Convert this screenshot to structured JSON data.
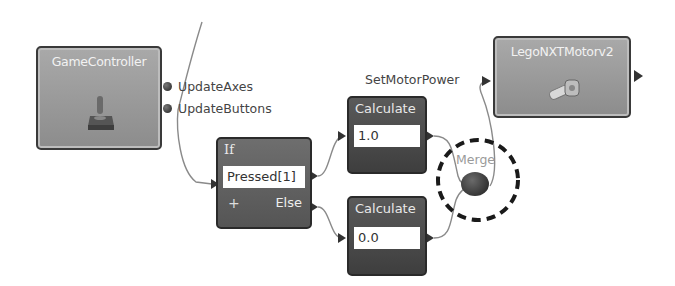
{
  "diagram": {
    "nodes": {
      "game_controller": {
        "title": "GameController",
        "icon": "joystick-icon",
        "outputs": [
          "UpdateAxes",
          "UpdateButtons"
        ]
      },
      "if_block": {
        "title": "If",
        "condition": "Pressed[1]",
        "add_label": "+",
        "else_label": "Else"
      },
      "calculate_top": {
        "title": "Calculate",
        "value": "1.0"
      },
      "calculate_bottom": {
        "title": "Calculate",
        "value": "0.0"
      },
      "merge": {
        "label": "Merge",
        "highlighted": true
      },
      "lego_motor": {
        "title": "LegoNXTMotorv2",
        "icon": "motor-icon",
        "input_label": "SetMotorPower"
      }
    },
    "colors": {
      "activity_fill": "#9e9e9e",
      "block_fill": "#4a4a4a",
      "wire": "#8a8a8a",
      "highlight_ring": "#1a1a1a"
    }
  }
}
